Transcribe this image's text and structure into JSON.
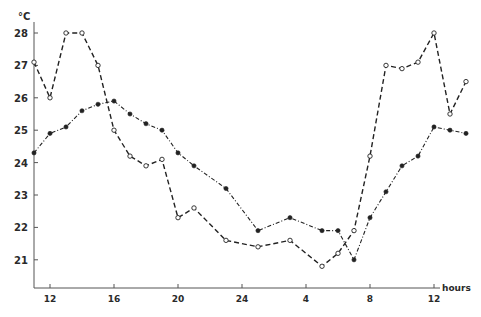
{
  "chart_data": {
    "type": "line",
    "title": "",
    "xlabel": "hours",
    "ylabel": "°C",
    "ylim": [
      20,
      28.4
    ],
    "yticks": [
      21,
      22,
      23,
      24,
      25,
      26,
      27,
      28
    ],
    "xticks": [
      {
        "pos": 12,
        "label": "12"
      },
      {
        "pos": 16,
        "label": "16"
      },
      {
        "pos": 20,
        "label": "20"
      },
      {
        "pos": 24,
        "label": "24"
      },
      {
        "pos": 28,
        "label": "4"
      },
      {
        "pos": 32,
        "label": "8"
      },
      {
        "pos": 36,
        "label": "12"
      }
    ],
    "xrange": [
      11,
      38.5
    ],
    "grid": false,
    "legend": null,
    "series": [
      {
        "name": "open-circles",
        "marker": "open-circle",
        "line": "dashed",
        "x": [
          11,
          12,
          13,
          14,
          15,
          16,
          17,
          18,
          19,
          20,
          21,
          23,
          25,
          27,
          29,
          30,
          31,
          32,
          33,
          34,
          35,
          36,
          37,
          38
        ],
        "values": [
          27.1,
          26.0,
          28.0,
          28.0,
          27.0,
          25.0,
          24.2,
          23.9,
          24.1,
          22.3,
          22.6,
          21.6,
          21.4,
          21.6,
          20.8,
          21.2,
          21.9,
          24.2,
          27.0,
          26.9,
          27.1,
          28.0,
          25.5,
          26.5
        ]
      },
      {
        "name": "filled-circles",
        "marker": "filled-circle",
        "line": "dash-dot",
        "x": [
          11,
          12,
          13,
          14,
          15,
          16,
          17,
          18,
          19,
          20,
          21,
          23,
          25,
          27,
          29,
          30,
          31,
          32,
          33,
          34,
          35,
          36,
          37,
          38
        ],
        "values": [
          24.3,
          24.9,
          25.1,
          25.6,
          25.8,
          25.9,
          25.5,
          25.2,
          25.0,
          24.3,
          23.9,
          23.2,
          21.9,
          22.3,
          21.9,
          21.9,
          21.0,
          22.3,
          23.1,
          23.9,
          24.2,
          25.1,
          25.0,
          24.9
        ]
      }
    ]
  },
  "labels": {
    "y_unit": "°C",
    "x_unit": "hours"
  }
}
